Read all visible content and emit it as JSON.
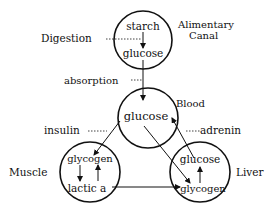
{
  "diagram": {
    "nodes": {
      "alimentary": {
        "label_line1": "Alimentary",
        "label_line2": "Canal",
        "top": "starch",
        "bottom": "glucose"
      },
      "blood": {
        "label": "Blood",
        "content": "glucose"
      },
      "muscle": {
        "label": "Muscle",
        "top": "glycogen",
        "bottom": "lactic a"
      },
      "liver": {
        "label": "Liver",
        "top": "glucose",
        "bottom": "glycogen"
      }
    },
    "processes": {
      "digestion": "Digestion",
      "absorption": "absorption",
      "insulin": "insulin",
      "adrenin": "adrenin"
    },
    "colors": {
      "ink": "#111111",
      "background": "#ffffff"
    }
  }
}
